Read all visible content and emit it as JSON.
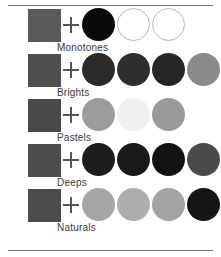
{
  "figure": {
    "background": "#ffffff",
    "rule_color": "#6f6f6f",
    "plus_symbol": "+",
    "label_color": "#3a3a3a"
  },
  "rows": [
    {
      "label": "Monotones",
      "base_swatch": {
        "name": "base-square",
        "color": "#5a5a5a"
      },
      "dots": [
        {
          "slot": 0,
          "color": "#0a0a0a",
          "style": "filled"
        },
        {
          "slot": 1,
          "color": "#ffffff",
          "style": "outline"
        },
        {
          "slot": 2,
          "color": "#ffffff",
          "style": "outline"
        }
      ]
    },
    {
      "label": "Brights",
      "base_swatch": {
        "name": "base-square",
        "color": "#4f4f4f"
      },
      "dots": [
        {
          "slot": 0,
          "color": "#2a2a2a",
          "style": "filled"
        },
        {
          "slot": 1,
          "color": "#2e2e2e",
          "style": "filled"
        },
        {
          "slot": 2,
          "color": "#262626",
          "style": "filled"
        },
        {
          "slot": 3,
          "color": "#8a8a8a",
          "style": "filled"
        }
      ]
    },
    {
      "label": "Pastels",
      "base_swatch": {
        "name": "base-square",
        "color": "#4a4a4a"
      },
      "dots": [
        {
          "slot": 0,
          "color": "#9c9c9c",
          "style": "filled"
        },
        {
          "slot": 1,
          "color": "#f0f0f0",
          "style": "filled"
        },
        {
          "slot": 2,
          "color": "#9a9a9a",
          "style": "filled"
        }
      ]
    },
    {
      "label": "Deeps",
      "base_swatch": {
        "name": "base-square",
        "color": "#4d4d4d"
      },
      "dots": [
        {
          "slot": 0,
          "color": "#1c1c1c",
          "style": "filled"
        },
        {
          "slot": 1,
          "color": "#191919",
          "style": "filled"
        },
        {
          "slot": 2,
          "color": "#121212",
          "style": "filled"
        },
        {
          "slot": 3,
          "color": "#4a4a4a",
          "style": "filled"
        }
      ]
    },
    {
      "label": "Naturals",
      "base_swatch": {
        "name": "base-square",
        "color": "#4b4b4b"
      },
      "dots": [
        {
          "slot": 0,
          "color": "#a6a6a6",
          "style": "filled"
        },
        {
          "slot": 1,
          "color": "#adadad",
          "style": "filled"
        },
        {
          "slot": 2,
          "color": "#a3a3a3",
          "style": "filled"
        },
        {
          "slot": 3,
          "color": "#151515",
          "style": "filled"
        }
      ]
    }
  ]
}
